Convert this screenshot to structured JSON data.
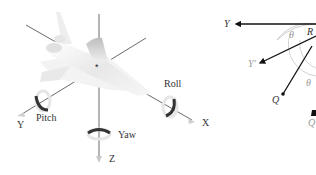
{
  "left_diagram": {
    "title": "Aircraft rotation axes",
    "axes": {
      "x_label": "X",
      "y_label": "Y",
      "z_label": "Z"
    },
    "rotations": {
      "roll_label": "Roll",
      "pitch_label": "Pitch",
      "yaw_label": "Yaw"
    },
    "center_marker": "*"
  },
  "right_diagram": {
    "labels": {
      "y": "Y",
      "y_prime": "Y'",
      "r": "R",
      "theta_top": "θ",
      "theta_bottom": "θ",
      "q": "Q",
      "q_prime": "Q"
    }
  },
  "colors": {
    "line": "#333333",
    "arrow": "#111111",
    "arc": "#b0b0b0",
    "label_grey": "#9a9a9a",
    "aircraft_light": "#f2f2f2",
    "aircraft_shade": "#c8c8c8"
  }
}
